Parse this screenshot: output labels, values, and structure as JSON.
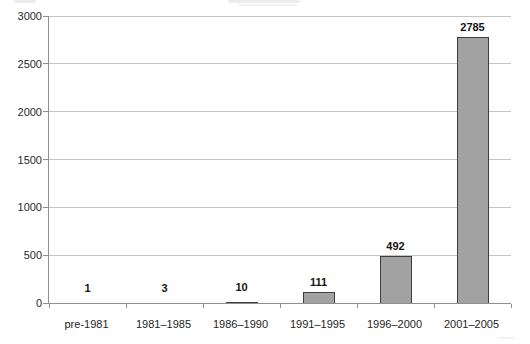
{
  "chart_data": {
    "type": "bar",
    "title": "",
    "xlabel": "",
    "ylabel": "",
    "categories": [
      "pre-1981",
      "1981–1985",
      "1986–1990",
      "1991–1995",
      "1996–2000",
      "2001–2005"
    ],
    "values": [
      1,
      3,
      10,
      111,
      492,
      2785
    ],
    "data_labels": [
      "1",
      "3",
      "10",
      "111",
      "492",
      "2785"
    ],
    "ylim": [
      0,
      3000
    ],
    "yticks": [
      0,
      500,
      1000,
      1500,
      2000,
      2500,
      3000
    ],
    "grid": "horizontal",
    "legend": "none",
    "colors": {
      "bar_fill": "#a2a2a2",
      "bar_border": "#3e3e3e",
      "gridline": "#c4c4c4",
      "axis": "#8f8f8f",
      "tick_label": "#2a2a2a",
      "value_label": "#141414"
    }
  }
}
